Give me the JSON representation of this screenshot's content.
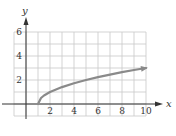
{
  "chart_data": {
    "type": "line",
    "title": "",
    "xlabel": "x",
    "ylabel": "y",
    "xlim": [
      -1,
      10
    ],
    "ylim": [
      -1,
      6
    ],
    "grid": true,
    "grid_step": 1,
    "x_ticks": [
      2,
      4,
      6,
      8,
      10
    ],
    "x_tick_labels": [
      "2",
      "4",
      "6",
      "8",
      "10"
    ],
    "y_ticks": [
      2,
      4,
      6
    ],
    "y_tick_labels": [
      "2",
      "4",
      "6"
    ],
    "series": [
      {
        "name": "y = sqrt(x - 1)",
        "x": [
          1,
          1.25,
          1.5,
          2,
          3,
          4,
          5,
          6,
          7,
          8,
          9,
          10
        ],
        "y": [
          0,
          0.5,
          0.71,
          1,
          1.41,
          1.73,
          2,
          2.24,
          2.45,
          2.65,
          2.83,
          3
        ],
        "end_arrow": true
      }
    ],
    "legend": null
  },
  "colors": {
    "grid": "#c8c8c8",
    "axis": "#333333",
    "curve": "#8a8a8a",
    "text": "#333333"
  }
}
